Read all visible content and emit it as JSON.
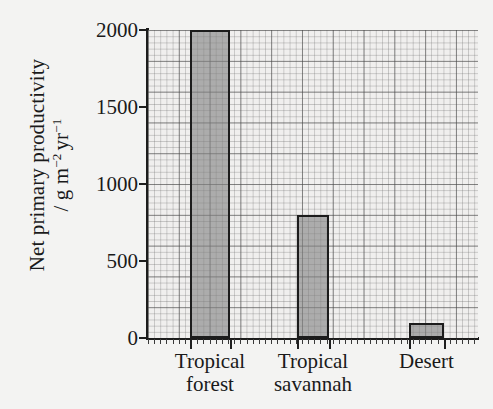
{
  "chart_data": {
    "type": "bar",
    "title": "",
    "xlabel": "",
    "ylabel": "Net primary productivity / g m⁻² yr⁻¹",
    "ylabel_line1": "Net primary productivity",
    "ylabel_line2_prefix": "/ g m",
    "ylabel_line2_sup1": "−2",
    "ylabel_line2_mid": "yr",
    "ylabel_line2_sup2": "−1",
    "categories": [
      "Tropical forest",
      "Tropical savannah",
      "Desert"
    ],
    "category_lines": [
      {
        "line1": "Tropical",
        "line2": "forest"
      },
      {
        "line1": "Tropical",
        "line2": "savannah"
      },
      {
        "line1": "Desert",
        "line2": ""
      }
    ],
    "values": [
      2000,
      800,
      100
    ],
    "ylim": [
      0,
      2000
    ],
    "yticks": [
      0,
      500,
      1000,
      1500,
      2000
    ],
    "ytick_labels": [
      "0",
      "500",
      "1000",
      "1500",
      "2000"
    ],
    "grid": "graph-paper minor and major gridlines",
    "legend": "none",
    "bar_fill_color": "#9a9a9a",
    "bar_edge_color": "#1c1c1c",
    "background_color": "#f3f3f2",
    "plot_background_color": "#f0efee",
    "axis_color": "#1c1c1c"
  }
}
